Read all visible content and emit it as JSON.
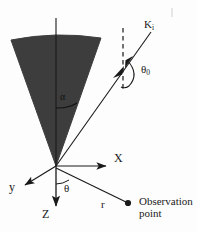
{
  "figure": {
    "type": "scientific-diagram",
    "background_color": "#fdfdfd",
    "ink_color": "#1a1a1a",
    "cone_fill_color": "#3d3d3d",
    "labels": {
      "k_incident": "K",
      "k_incident_sub": "i",
      "theta_zero": "θ",
      "theta_zero_sub": "0",
      "cone_half_angle": "α",
      "axis_x": "X",
      "axis_y": "y",
      "axis_z": "Z",
      "polar_angle": "θ",
      "radius": "r",
      "observation_point": "Observation point"
    },
    "geometry": {
      "origin": [
        56,
        166
      ],
      "cone_apex": [
        56,
        166
      ],
      "cone_left_edge": [
        11,
        40
      ],
      "cone_right_edge": [
        101,
        38
      ],
      "cone_arc_sag": 7,
      "vertical_axis_top": [
        56,
        18
      ],
      "axis_z_end": [
        56,
        212
      ],
      "axis_x_end": [
        110,
        165
      ],
      "axis_y_end": [
        21,
        187
      ],
      "k_ray_end": [
        152,
        31
      ],
      "dashed_line_x": 123,
      "dashed_line_top": 28,
      "dashed_line_bottom": 92,
      "observation_dot": [
        128,
        203
      ],
      "alpha_arc_end": [
        77,
        103
      ]
    }
  }
}
